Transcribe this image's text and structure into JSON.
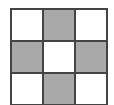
{
  "diagram": {
    "type": "grid",
    "rows": 3,
    "cols": 3,
    "colors": {
      "shaded": "#a9a9a9",
      "empty": "#ffffff",
      "line": "#444444"
    },
    "cells": [
      [
        false,
        true,
        false
      ],
      [
        true,
        false,
        true
      ],
      [
        false,
        true,
        false
      ]
    ]
  }
}
